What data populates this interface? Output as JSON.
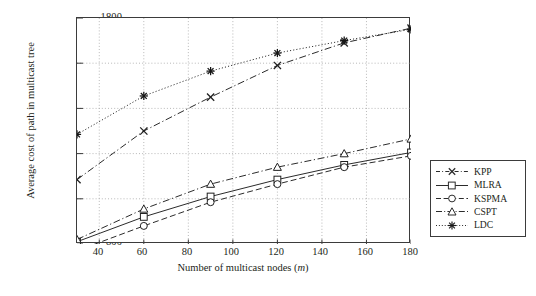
{
  "chart_data": {
    "type": "line",
    "title": "",
    "xlabel": "Number of multicast nodes (m)",
    "ylabel": "Average cost of path in multicast tree",
    "x": [
      30,
      60,
      90,
      120,
      150,
      180
    ],
    "xlim": [
      30,
      180
    ],
    "ylim": [
      800,
      1800
    ],
    "xticks": [
      40,
      60,
      80,
      100,
      120,
      140,
      160,
      180
    ],
    "yticks": [
      800,
      1000,
      1200,
      1400,
      1600,
      1800
    ],
    "grid": "dotted-both",
    "legend_position": "right-outside",
    "series": [
      {
        "name": "KPP",
        "marker": "x",
        "linestyle": "dash-dot",
        "color": "#2b2b2b",
        "values": [
          1085,
          1300,
          1450,
          1590,
          1690,
          1755
        ]
      },
      {
        "name": "MLRA",
        "marker": "square",
        "linestyle": "solid",
        "color": "#2b2b2b",
        "values": [
          810,
          920,
          1010,
          1085,
          1150,
          1205
        ]
      },
      {
        "name": "KSPMA",
        "marker": "circle",
        "linestyle": "dashed",
        "color": "#2b2b2b",
        "values": [
          770,
          880,
          985,
          1065,
          1140,
          1190
        ]
      },
      {
        "name": "CSPT",
        "marker": "triangle",
        "linestyle": "dash-dot",
        "color": "#2b2b2b",
        "values": [
          820,
          955,
          1065,
          1140,
          1200,
          1265
        ]
      },
      {
        "name": "LDC",
        "marker": "star",
        "linestyle": "dotted",
        "color": "#2b2b2b",
        "values": [
          1285,
          1455,
          1565,
          1645,
          1700,
          1750
        ]
      }
    ]
  },
  "axes": {
    "y_tick_labels": [
      "800",
      "1000",
      "1200",
      "1400",
      "1600",
      "1800"
    ],
    "x_tick_labels": [
      "40",
      "60",
      "80",
      "100",
      "120",
      "140",
      "160",
      "180"
    ],
    "y_title": "Average cost of path in multicast tree",
    "x_title_main": "Number of multicast nodes (",
    "x_title_italic": "m",
    "x_title_end": ")"
  },
  "legend": {
    "entries": [
      {
        "label": "KPP"
      },
      {
        "label": "MLRA"
      },
      {
        "label": "KSPMA"
      },
      {
        "label": "CSPT"
      },
      {
        "label": "LDC"
      }
    ]
  }
}
